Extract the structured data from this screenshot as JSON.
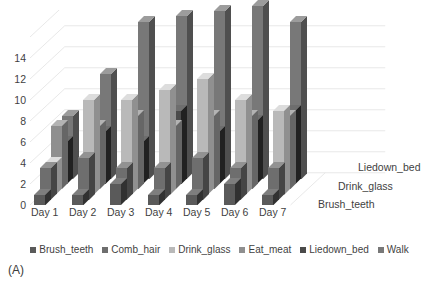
{
  "panel": {
    "label": "(A)",
    "title_cutoff": ""
  },
  "chart_data": {
    "type": "bar",
    "variant": "3d-clustered-column",
    "title": "",
    "xlabel": "",
    "ylabel": "",
    "zlabel": "",
    "ylim": [
      0,
      16
    ],
    "yticks": [
      0,
      2,
      4,
      6,
      8,
      10,
      12,
      14
    ],
    "ytick_labels": [
      "0",
      "2",
      "4",
      "6",
      "8",
      "10",
      "12",
      "14"
    ],
    "grid": true,
    "legend_position": "bottom",
    "categories": [
      "Day 1",
      "Day 2",
      "Day 3",
      "Day 4",
      "Day 5",
      "Day 6",
      "Day 7"
    ],
    "depth_axis_labels": [
      "Brush_teeth",
      "Drink_glass",
      "Liedown_bed"
    ],
    "series": [
      {
        "name": "Brush_teeth",
        "color": "#5a5a5a",
        "values": [
          1,
          1,
          2,
          1,
          1,
          2,
          1
        ]
      },
      {
        "name": "Comb_hair",
        "color": "#6e6e6e",
        "values": [
          3,
          4,
          3,
          3,
          4,
          3,
          3
        ]
      },
      {
        "name": "Drink_glass",
        "color": "#b9b9b9",
        "values": [
          3,
          9,
          9,
          10,
          11,
          9,
          8
        ]
      },
      {
        "name": "Eat_meat",
        "color": "#8f8f8f",
        "values": [
          6,
          6,
          7,
          6,
          7,
          7,
          7
        ]
      },
      {
        "name": "Liedown_bed",
        "color": "#4a4a4a",
        "values": [
          4,
          5,
          4,
          7,
          5,
          6,
          7
        ]
      },
      {
        "name": "Walk",
        "color": "#787878",
        "values": [
          6,
          10,
          15,
          15.5,
          16,
          16.5,
          15
        ]
      }
    ]
  },
  "legend": {
    "items": [
      {
        "label": "Brush_teeth",
        "color": "#5a5a5a"
      },
      {
        "label": "Comb_hair",
        "color": "#6e6e6e"
      },
      {
        "label": "Drink_glass",
        "color": "#b9b9b9"
      },
      {
        "label": "Eat_meat",
        "color": "#8f8f8f"
      },
      {
        "label": "Liedown_bed",
        "color": "#4a4a4a"
      },
      {
        "label": "Walk",
        "color": "#787878"
      }
    ]
  },
  "style": {
    "background": "#ffffff",
    "grid_color": "#e2e2e2",
    "text_color": "#3f3f3f"
  }
}
